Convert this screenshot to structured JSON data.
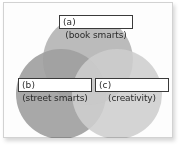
{
  "figure": {
    "type": "venn-diagram",
    "background_color": "#ffffff",
    "border_color": "#d2d2d2",
    "set_count": 3
  },
  "sets": [
    {
      "id": "a",
      "tag": "(a)",
      "label": "(book smarts)",
      "position": "top",
      "fill_color": "#9e9e9e",
      "center": {
        "x": 85,
        "y": 58
      },
      "radius": 45
    },
    {
      "id": "b",
      "tag": "(b)",
      "label": "(street smarts)",
      "position": "bottom-left",
      "fill_color": "#8a8a8a",
      "center": {
        "x": 58,
        "y": 92
      },
      "radius": 45
    },
    {
      "id": "c",
      "tag": "(c)",
      "label": "(creativity)",
      "position": "bottom-right",
      "fill_color": "#bdbdbd",
      "center": {
        "x": 114,
        "y": 92
      },
      "radius": 45
    }
  ],
  "colors": {
    "overlap_ab": "#8f8f8f",
    "overlap_ac": "#a8a8a8",
    "overlap_bc": "#9a9a9a",
    "overlap_abc": "#7e7e7e",
    "tag_box_fill": "#ffffff",
    "tag_box_border": "#3a3a3a",
    "text": "#2b2b2b"
  }
}
